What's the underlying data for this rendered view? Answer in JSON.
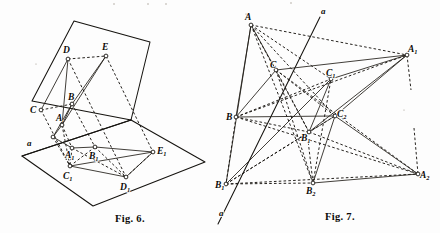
{
  "plate": {
    "name": "geometry-figures-plate",
    "background_color": "#fdfdfd",
    "ink_color": "#15130f",
    "width": 440,
    "height": 233
  },
  "figures": [
    {
      "id": "fig6",
      "caption": "Fig. 6.",
      "caption_x": 115,
      "caption_y": 222,
      "description": "Two intersecting planes carrying perspective figures ABCDE and A1B1C1D1E1 with axis a",
      "line_labels": [
        {
          "name": "axis-label-a",
          "text": "a",
          "x": 27,
          "y": 144
        }
      ],
      "points": [
        {
          "name": "point-D",
          "label": "D",
          "sub": "",
          "x": 68,
          "y": 59,
          "lx": 63,
          "ly": 53
        },
        {
          "name": "point-E",
          "label": "E",
          "sub": "",
          "x": 106,
          "y": 56,
          "lx": 102,
          "ly": 50
        },
        {
          "name": "point-C",
          "label": "C",
          "sub": "",
          "x": 41,
          "y": 110,
          "lx": 31,
          "ly": 111
        },
        {
          "name": "point-B",
          "label": "B",
          "sub": "",
          "x": 72,
          "y": 104,
          "lx": 68,
          "ly": 99
        },
        {
          "name": "point-A",
          "label": "A",
          "sub": "",
          "x": 62,
          "y": 125,
          "lx": 57,
          "ly": 120
        },
        {
          "name": "point-A1",
          "label": "A",
          "sub": "1",
          "x": 72,
          "y": 148,
          "lx": 66,
          "ly": 156
        },
        {
          "name": "point-B1",
          "label": "B",
          "sub": "1",
          "x": 95,
          "y": 147,
          "lx": 90,
          "ly": 157
        },
        {
          "name": "point-C1",
          "label": "C",
          "sub": "1",
          "x": 70,
          "y": 166,
          "lx": 64,
          "ly": 177
        },
        {
          "name": "point-D1",
          "label": "D",
          "sub": "1",
          "x": 126,
          "y": 177,
          "lx": 121,
          "ly": 188
        },
        {
          "name": "point-E1",
          "label": "E",
          "sub": "1",
          "x": 153,
          "y": 152,
          "lx": 157,
          "ly": 151
        },
        {
          "name": "point-axis-vertex",
          "label": "",
          "sub": "",
          "x": 53,
          "y": 137,
          "lx": 0,
          "ly": 0
        }
      ]
    },
    {
      "id": "fig7",
      "caption": "Fig. 7.",
      "caption_x": 325,
      "caption_y": 220,
      "description": "Plane perspective: triangles ABC, A1B1C1, A2B2C2 in perspective from centres on axis a",
      "line_labels": [
        {
          "name": "axis-label-a-top",
          "text": "a",
          "x": 322,
          "y": 12
        },
        {
          "name": "axis-label-a-bottom",
          "text": "a",
          "x": 222,
          "y": 214
        }
      ],
      "points": [
        {
          "name": "point-A",
          "label": "A",
          "sub": "",
          "x": 251,
          "y": 25,
          "lx": 246,
          "ly": 19
        },
        {
          "name": "point-C",
          "label": "C",
          "sub": "",
          "x": 276,
          "y": 70,
          "lx": 271,
          "ly": 67
        },
        {
          "name": "point-B",
          "label": "B",
          "sub": "",
          "x": 236,
          "y": 117,
          "lx": 227,
          "ly": 118
        },
        {
          "name": "point-A1",
          "label": "A",
          "sub": "1",
          "x": 407,
          "y": 55,
          "lx": 409,
          "ly": 51
        },
        {
          "name": "point-C1",
          "label": "C",
          "sub": "1",
          "x": 331,
          "y": 79,
          "lx": 328,
          "ly": 74
        },
        {
          "name": "point-B1",
          "label": "B",
          "sub": "1",
          "x": 309,
          "y": 132,
          "lx": 303,
          "ly": 139
        },
        {
          "name": "point-A2",
          "label": "A",
          "sub": "2",
          "x": 418,
          "y": 174,
          "lx": 421,
          "ly": 178
        },
        {
          "name": "point-C2",
          "label": "C",
          "sub": "2",
          "x": 335,
          "y": 116,
          "lx": 337,
          "ly": 116
        },
        {
          "name": "point-B2",
          "label": "B",
          "sub": "2",
          "x": 313,
          "y": 183,
          "lx": 307,
          "ly": 193
        },
        {
          "name": "point-B1-low",
          "label": "B",
          "sub": "1",
          "x": 226,
          "y": 184,
          "lx": 217,
          "ly": 186
        }
      ]
    }
  ]
}
